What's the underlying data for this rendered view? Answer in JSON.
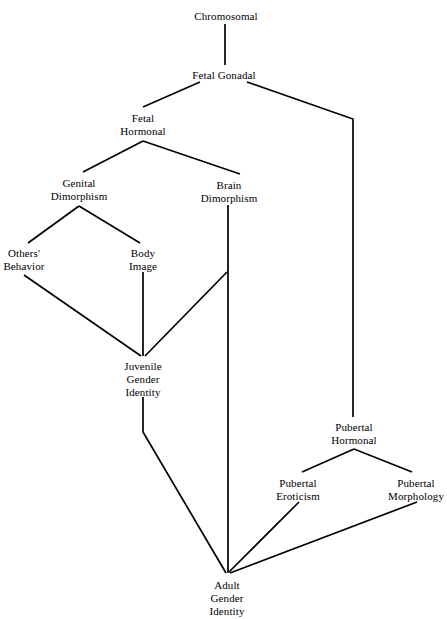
{
  "diagram": {
    "type": "flow-diagram",
    "background_color": "#ffffff",
    "line_color": "#000000",
    "text_color": "#000000",
    "width": 447,
    "height": 619,
    "nodes": [
      {
        "id": "chromosomal",
        "lines": [
          "Chromosomal"
        ],
        "x": 226,
        "y": 10
      },
      {
        "id": "fetal-gonadal",
        "lines": [
          "Fetal Gonadal"
        ],
        "x": 224,
        "y": 69
      },
      {
        "id": "fetal-hormonal",
        "lines": [
          "Fetal",
          "Hormonal"
        ],
        "x": 143,
        "y": 112
      },
      {
        "id": "genital-dimorphism",
        "lines": [
          "Genital",
          "Dimorphism"
        ],
        "x": 79,
        "y": 177
      },
      {
        "id": "brain-dimorphism",
        "lines": [
          "Brain",
          "Dimorphism"
        ],
        "x": 229,
        "y": 179
      },
      {
        "id": "others-behavior",
        "lines": [
          "Others'",
          "Behavior"
        ],
        "x": 24,
        "y": 247
      },
      {
        "id": "body-image",
        "lines": [
          "Body",
          "Image"
        ],
        "x": 143,
        "y": 247
      },
      {
        "id": "juvenile-gender-identity",
        "lines": [
          "Juvenile",
          "Gender",
          "Identity"
        ],
        "x": 143,
        "y": 360
      },
      {
        "id": "pubertal-hormonal",
        "lines": [
          "Pubertal",
          "Hormonal"
        ],
        "x": 354,
        "y": 421
      },
      {
        "id": "pubertal-eroticism",
        "lines": [
          "Pubertal",
          "Eroticism"
        ],
        "x": 298,
        "y": 477
      },
      {
        "id": "pubertal-morphology",
        "lines": [
          "Pubertal",
          "Morphology"
        ],
        "x": 416,
        "y": 477
      },
      {
        "id": "adult-gender-identity",
        "lines": [
          "Adult",
          "Gender",
          "Identity"
        ],
        "x": 227,
        "y": 579
      }
    ],
    "edges": [
      {
        "id": "chromosomal-to-fetal-gonadal",
        "from": "chromosomal",
        "to": "fetal-gonadal",
        "points": "225,24 225,65"
      },
      {
        "id": "fetal-gonadal-to-fetal-hormonal",
        "from": "fetal-gonadal",
        "to": "fetal-hormonal",
        "points": "200,82 143,107"
      },
      {
        "id": "fetal-gonadal-to-pubertal-hormonal",
        "from": "fetal-gonadal",
        "to": "pubertal-hormonal",
        "points": "247,82 353,119 353,417"
      },
      {
        "id": "fetal-hormonal-to-genital-dimorphism",
        "from": "fetal-hormonal",
        "to": "genital-dimorphism",
        "points": "143,141 83,172"
      },
      {
        "id": "fetal-hormonal-to-brain-dimorphism",
        "from": "fetal-hormonal",
        "to": "brain-dimorphism",
        "points": "143,141 240,174"
      },
      {
        "id": "genital-dimorphism-to-others-behavior",
        "from": "genital-dimorphism",
        "to": "others-behavior",
        "points": "79,206 28,243"
      },
      {
        "id": "genital-dimorphism-to-body-image",
        "from": "genital-dimorphism",
        "to": "body-image",
        "points": "79,206 140,243"
      },
      {
        "id": "others-behavior-to-juvenile",
        "from": "others-behavior",
        "to": "juvenile-gender-identity",
        "points": "24,275 141,356"
      },
      {
        "id": "body-image-to-juvenile",
        "from": "body-image",
        "to": "juvenile-gender-identity",
        "points": "143,272 143,356"
      },
      {
        "id": "brain-dimorphism-to-juvenile",
        "from": "brain-dimorphism",
        "to": "juvenile-gender-identity",
        "points": "227,272 145,356"
      },
      {
        "id": "brain-dimorphism-to-adult",
        "from": "brain-dimorphism",
        "to": "adult-gender-identity",
        "points": "228,205 228,573"
      },
      {
        "id": "juvenile-to-adult",
        "from": "juvenile-gender-identity",
        "to": "adult-gender-identity",
        "points": "143,397 143,432 226,573"
      },
      {
        "id": "pubertal-hormonal-to-eroticism",
        "from": "pubertal-hormonal",
        "to": "pubertal-eroticism",
        "points": "354,449 302,472"
      },
      {
        "id": "pubertal-hormonal-to-morphology",
        "from": "pubertal-hormonal",
        "to": "pubertal-morphology",
        "points": "354,449 412,472"
      },
      {
        "id": "pubertal-eroticism-to-adult",
        "from": "pubertal-eroticism",
        "to": "adult-gender-identity",
        "points": "299,502 229,572"
      },
      {
        "id": "pubertal-morphology-to-adult",
        "from": "pubertal-morphology",
        "to": "adult-gender-identity",
        "points": "417,502 230,573"
      }
    ]
  }
}
